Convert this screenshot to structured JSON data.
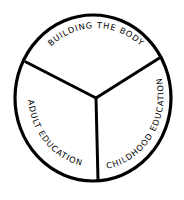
{
  "diagram": {
    "type": "three-segment-circle",
    "colors": {
      "stroke": "#000000",
      "background": "#ffffff",
      "text": "#000000"
    },
    "segments": [
      {
        "id": "top",
        "label": "BUILDING  THE BODY"
      },
      {
        "id": "left",
        "label": "ADULT  EDUCATION"
      },
      {
        "id": "right",
        "label": "CHILDHOOD  EDUCATION"
      }
    ]
  }
}
